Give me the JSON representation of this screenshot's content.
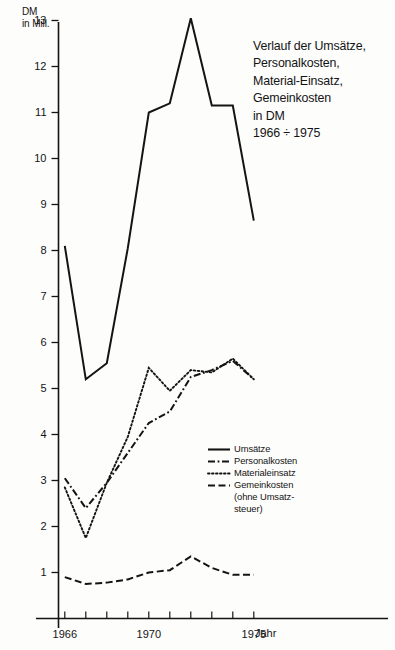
{
  "chart_data": {
    "type": "line",
    "title": "Verlauf der Umsätze,\nPersonalkosten,\nMaterial-Einsatz,\nGemeinkosten\nin DM\n1966 ÷ 1975",
    "ylabel": "DM\nin Mill.",
    "xlabel": "Jahr",
    "x": [
      1966,
      1967,
      1968,
      1969,
      1970,
      1971,
      1972,
      1973,
      1974,
      1975
    ],
    "xlim": [
      1965.5,
      1975.8
    ],
    "ylim": [
      0,
      13.4
    ],
    "grid": false,
    "legend_position": "center-right",
    "x_tick_labels": [
      "1966",
      "1970",
      "1975"
    ],
    "x_tick_label_years": [
      1966,
      1970,
      1975
    ],
    "y_tick_labels": [
      "13",
      "12",
      "11",
      "10",
      "9",
      "8",
      "7",
      "6",
      "5",
      "4",
      "3",
      "2",
      "1"
    ],
    "y_tick_values": [
      13,
      12,
      11,
      10,
      9,
      8,
      7,
      6,
      5,
      4,
      3,
      2,
      1
    ],
    "series": [
      {
        "name": "Umsätze",
        "style": "solid",
        "values": [
          8.1,
          5.2,
          5.55,
          8.05,
          11.0,
          11.2,
          13.05,
          11.15,
          11.15,
          8.65
        ]
      },
      {
        "name": "Personalkosten",
        "style": "dash-dot",
        "values": [
          3.05,
          2.4,
          2.95,
          3.6,
          4.25,
          4.5,
          5.25,
          5.4,
          5.6,
          5.2
        ]
      },
      {
        "name": "Materialeinsatz",
        "style": "dotted",
        "values": [
          2.85,
          1.75,
          2.95,
          3.95,
          5.45,
          4.95,
          5.4,
          5.35,
          5.65,
          5.2
        ]
      },
      {
        "name": "Gemeinkosten",
        "name_note": "(ohne Umsatz-\nsteuer)",
        "style": "dashed",
        "values": [
          0.9,
          0.75,
          0.78,
          0.85,
          1.0,
          1.05,
          1.35,
          1.1,
          0.95,
          0.95
        ]
      }
    ]
  },
  "legend": {
    "entries": [
      {
        "label": "Umsätze",
        "sub": ""
      },
      {
        "label": "Personalkosten",
        "sub": ""
      },
      {
        "label": "Materialeinsatz",
        "sub": ""
      },
      {
        "label": "Gemeinkosten",
        "sub": "(ohne Umsatz-\nsteuer)"
      }
    ]
  },
  "colors": {
    "ink": "#141414",
    "background": "#fdfdfc"
  }
}
